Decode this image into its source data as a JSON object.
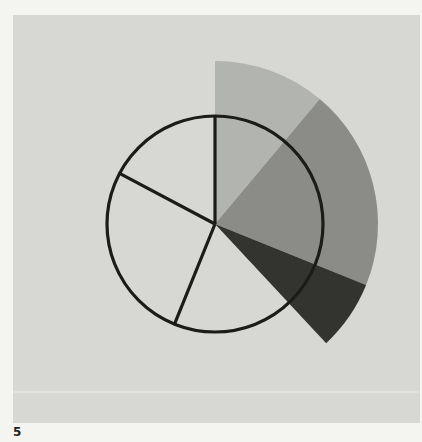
{
  "figure": {
    "label": "5"
  },
  "palette": {
    "margin": "#f4f4f1",
    "paper": "#d7d8d3",
    "outline": "#1b1b19",
    "crease": "#e4e5e0",
    "label_color": "#1f1f1d"
  },
  "chart_data": {
    "type": "pie",
    "title": "",
    "figure_label": "5",
    "angle_unit": "degrees clockwise from 12 o'clock",
    "center": {
      "x": 215,
      "y": 224
    },
    "circle_radius": 108,
    "fan_radius": 163,
    "outline_width": 3.2,
    "outline_color": "#1b1b19",
    "radial_lines_deg": [
      0,
      202,
      298
    ],
    "shaded_sectors": [
      {
        "label": "light-gray-sector",
        "start_deg": 0,
        "end_deg": 40,
        "sweep_deg": 40,
        "color": "#b2b4af"
      },
      {
        "label": "medium-gray-sector",
        "start_deg": 40,
        "end_deg": 112,
        "sweep_deg": 72,
        "color": "#8b8c87"
      },
      {
        "label": "dark-gray-sector",
        "start_deg": 112,
        "end_deg": 137,
        "sweep_deg": 25,
        "color": "#33332f"
      }
    ],
    "unshaded_slices_deg": [
      [
        137,
        202
      ],
      [
        202,
        298
      ],
      [
        298,
        360
      ]
    ],
    "legend": "none",
    "grid": false
  }
}
